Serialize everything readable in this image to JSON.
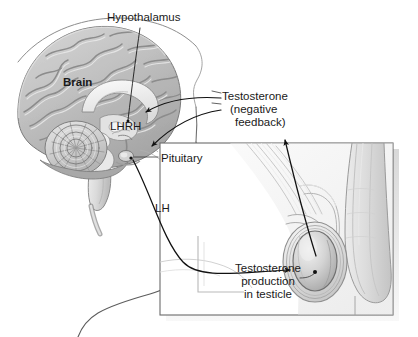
{
  "figure": {
    "type": "anatomical-diagram",
    "background_color": "#ffffff",
    "ink_color": "#1a1a1a"
  },
  "labels": {
    "hypothalamus": "Hypothalamus",
    "brain": "Brain",
    "lhrh": "LHRH",
    "pituitary": "Pituitary",
    "lh": "LH",
    "testosterone_line1": "Testosterone",
    "testosterone_line2": "(negative",
    "testosterone_line3": "feedback)",
    "production_line1": "Testosterone",
    "production_line2": "production",
    "production_line3": "in testicle"
  },
  "illustrations": {
    "brain_sagittal": "brain-sagittal-section",
    "head_profile": "head-profile-outline",
    "cerebellum": "cerebellum",
    "brainstem": "brainstem",
    "corpus_callosum": "corpus-callosum",
    "pituitary_gland": "pituitary-gland",
    "inset_panel": "male-pelvis-inset-panel",
    "testicle": "testicle",
    "scrotum": "scrotum-layers",
    "penis": "penis-shaft"
  },
  "connectors": {
    "hypothalamus_leader": "leader-line-to-hypothalamus",
    "feedback_to_hypothalamus": "curved-arrow-testosterone-to-hypothalamus",
    "feedback_to_pituitary": "curved-arrow-testosterone-to-pituitary",
    "lh_to_testicle": "curved-arrow-lh-pituitary-to-testicle",
    "testicle_to_feedback": "curved-arrow-testicle-to-feedback-label",
    "pituitary_leader": "leader-line-to-pituitary",
    "production_leader": "leader-line-to-testicle-interior"
  }
}
